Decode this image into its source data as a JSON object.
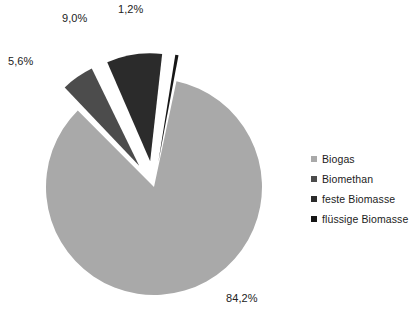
{
  "chart_data": {
    "type": "pie",
    "title": "",
    "subtitle": "",
    "xlabel": "",
    "ylabel": "",
    "grid": false,
    "legend_position": "right",
    "categories": [
      "Biogas",
      "Biomethan",
      "feste Biomasse",
      "flüssige Biomasse"
    ],
    "values": [
      84.2,
      5.6,
      9.0,
      1.2
    ],
    "value_labels": [
      "84,2%",
      "5,6%",
      "9,0%",
      "1,2%"
    ],
    "colors": [
      "#a9a9a9",
      "#4c4c4c",
      "#2b2b2b",
      "#161616"
    ],
    "exploded": [
      false,
      true,
      true,
      true
    ],
    "slices": [
      {
        "name": "Biogas",
        "value": 84.2,
        "label": "84,2%",
        "color": "#a9a9a9"
      },
      {
        "name": "Biomethan",
        "value": 5.6,
        "label": "5,6%",
        "color": "#4c4c4c"
      },
      {
        "name": "feste Biomasse",
        "value": 9.0,
        "label": "9,0%",
        "color": "#2b2b2b"
      },
      {
        "name": "flüssige Biomasse",
        "value": 1.2,
        "label": "1,2%",
        "color": "#161616"
      }
    ]
  },
  "legend": {
    "items": [
      {
        "label": "Biogas",
        "color": "#a9a9a9"
      },
      {
        "label": "Biomethan",
        "color": "#4c4c4c"
      },
      {
        "label": "feste Biomasse",
        "color": "#2b2b2b"
      },
      {
        "label": "flüssige Biomasse",
        "color": "#161616"
      }
    ]
  },
  "labels": {
    "biogas": "84,2%",
    "biomethan": "5,6%",
    "feste": "9,0%",
    "fluessige": "1,2%"
  }
}
